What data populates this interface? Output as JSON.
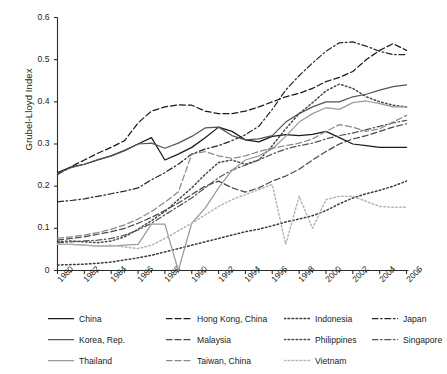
{
  "axes": {
    "ylabel": "Grubel-Lloyd Index",
    "yticks": [
      "0",
      "0.1",
      "0.2",
      "0.3",
      "0.4",
      "0.5",
      "0.6"
    ],
    "xticks": [
      "1980",
      "1982",
      "1984",
      "1986",
      "1988",
      "1990",
      "1992",
      "1994",
      "1996",
      "1998",
      "2000",
      "2002",
      "2004",
      "2006"
    ]
  },
  "legend": {
    "items": [
      {
        "label": "China",
        "style": "solid",
        "color": "#1a1a1a"
      },
      {
        "label": "Hong Kong, China",
        "style": "dashed",
        "color": "#1a1a1a"
      },
      {
        "label": "Indonesia",
        "style": "dotted",
        "color": "#3a3a3a"
      },
      {
        "label": "Japan",
        "style": "dashdot",
        "color": "#2a2a2a"
      },
      {
        "label": "Korea, Rep.",
        "style": "solid",
        "color": "#555555"
      },
      {
        "label": "Malaysia",
        "style": "dashed",
        "color": "#4a4a4a"
      },
      {
        "label": "Philippines",
        "style": "dotted",
        "color": "#4a4a4a"
      },
      {
        "label": "Singapore",
        "style": "dashdot",
        "color": "#555555"
      },
      {
        "label": "Thailand",
        "style": "solid",
        "color": "#9a9a9a"
      },
      {
        "label": "Taiwan, China",
        "style": "dashed",
        "color": "#8a8a8a"
      },
      {
        "label": "Vietnam",
        "style": "dotted",
        "color": "#b5b5b5"
      }
    ]
  },
  "chart_data": {
    "type": "line",
    "title": "",
    "xlabel": "",
    "ylabel": "Grubel-Lloyd Index",
    "xlim": [
      1980,
      2006
    ],
    "ylim": [
      0,
      0.6
    ],
    "grid": false,
    "legend_position": "below",
    "x": [
      1980,
      1981,
      1982,
      1983,
      1984,
      1985,
      1986,
      1987,
      1988,
      1989,
      1990,
      1991,
      1992,
      1993,
      1994,
      1995,
      1996,
      1997,
      1998,
      1999,
      2000,
      2001,
      2002,
      2003,
      2004,
      2005,
      2006
    ],
    "series": [
      {
        "name": "China",
        "style": "solid",
        "color": "#1a1a1a",
        "values": [
          0.232,
          0.245,
          0.252,
          0.262,
          0.272,
          0.285,
          0.3,
          0.315,
          0.262,
          0.276,
          0.292,
          0.315,
          0.34,
          0.33,
          0.31,
          0.305,
          0.318,
          0.322,
          0.32,
          0.323,
          0.33,
          0.315,
          0.3,
          0.296,
          0.292,
          0.292,
          0.292
        ]
      },
      {
        "name": "Hong Kong, China",
        "style": "dashed",
        "color": "#1a1a1a",
        "values": [
          0.228,
          0.246,
          0.262,
          0.278,
          0.292,
          0.308,
          0.35,
          0.378,
          0.388,
          0.393,
          0.392,
          0.378,
          0.372,
          0.372,
          0.378,
          0.388,
          0.4,
          0.412,
          0.42,
          0.432,
          0.448,
          0.458,
          0.472,
          0.5,
          0.522,
          0.538,
          0.522
        ]
      },
      {
        "name": "Indonesia",
        "style": "dotted",
        "color": "#3a3a3a",
        "values": [
          0.013,
          0.014,
          0.015,
          0.017,
          0.02,
          0.025,
          0.03,
          0.036,
          0.044,
          0.052,
          0.06,
          0.068,
          0.076,
          0.084,
          0.092,
          0.098,
          0.106,
          0.115,
          0.122,
          0.13,
          0.142,
          0.158,
          0.172,
          0.182,
          0.19,
          0.2,
          0.212
        ]
      },
      {
        "name": "Japan",
        "style": "dashdot",
        "color": "#2a2a2a",
        "values": [
          0.163,
          0.166,
          0.17,
          0.176,
          0.182,
          0.188,
          0.196,
          0.215,
          0.232,
          0.252,
          0.276,
          0.288,
          0.296,
          0.308,
          0.322,
          0.342,
          0.382,
          0.428,
          0.462,
          0.492,
          0.52,
          0.54,
          0.542,
          0.532,
          0.52,
          0.512,
          0.512
        ]
      },
      {
        "name": "Korea, Rep.",
        "style": "solid",
        "color": "#555555",
        "values": [
          0.23,
          0.244,
          0.252,
          0.263,
          0.272,
          0.284,
          0.3,
          0.302,
          0.29,
          0.302,
          0.318,
          0.338,
          0.34,
          0.32,
          0.31,
          0.312,
          0.32,
          0.352,
          0.372,
          0.388,
          0.4,
          0.4,
          0.412,
          0.418,
          0.428,
          0.436,
          0.44
        ]
      },
      {
        "name": "Malaysia",
        "style": "dashed",
        "color": "#4a4a4a",
        "values": [
          0.072,
          0.076,
          0.08,
          0.086,
          0.092,
          0.1,
          0.112,
          0.126,
          0.142,
          0.16,
          0.18,
          0.2,
          0.212,
          0.196,
          0.186,
          0.196,
          0.212,
          0.224,
          0.24,
          0.262,
          0.282,
          0.3,
          0.312,
          0.32,
          0.33,
          0.34,
          0.348
        ]
      },
      {
        "name": "Philippines",
        "style": "dotted",
        "color": "#4a4a4a",
        "values": [
          0.068,
          0.07,
          0.068,
          0.066,
          0.07,
          0.08,
          0.098,
          0.118,
          0.14,
          0.168,
          0.196,
          0.228,
          0.256,
          0.262,
          0.252,
          0.262,
          0.296,
          0.336,
          0.372,
          0.398,
          0.426,
          0.442,
          0.432,
          0.412,
          0.4,
          0.392,
          0.388
        ]
      },
      {
        "name": "Singapore",
        "style": "dashdot",
        "color": "#555555",
        "values": [
          0.066,
          0.068,
          0.07,
          0.072,
          0.076,
          0.084,
          0.096,
          0.112,
          0.132,
          0.152,
          0.172,
          0.196,
          0.22,
          0.238,
          0.25,
          0.262,
          0.276,
          0.288,
          0.296,
          0.302,
          0.312,
          0.32,
          0.326,
          0.334,
          0.342,
          0.35,
          0.356
        ]
      },
      {
        "name": "Thailand",
        "style": "solid",
        "color": "#9a9a9a",
        "values": [
          0.062,
          0.062,
          0.06,
          0.058,
          0.058,
          0.06,
          0.062,
          0.11,
          0.11,
          0.0,
          0.112,
          0.148,
          0.196,
          0.238,
          0.262,
          0.272,
          0.288,
          0.318,
          0.352,
          0.372,
          0.386,
          0.382,
          0.398,
          0.402,
          0.396,
          0.388,
          0.388
        ]
      },
      {
        "name": "Taiwan, China",
        "style": "dashed",
        "color": "#8a8a8a",
        "values": [
          0.076,
          0.08,
          0.084,
          0.09,
          0.098,
          0.108,
          0.122,
          0.14,
          0.162,
          0.186,
          0.276,
          0.282,
          0.272,
          0.266,
          0.272,
          0.282,
          0.29,
          0.296,
          0.302,
          0.312,
          0.33,
          0.346,
          0.34,
          0.33,
          0.336,
          0.352,
          0.368
        ]
      },
      {
        "name": "Vietnam",
        "style": "dotted",
        "color": "#b5b5b5",
        "values": [
          0.062,
          0.062,
          0.06,
          0.058,
          0.06,
          0.056,
          0.052,
          0.06,
          0.076,
          0.094,
          0.112,
          0.132,
          0.152,
          0.168,
          0.18,
          0.192,
          0.204,
          0.062,
          0.176,
          0.1,
          0.168,
          0.176,
          0.176,
          0.164,
          0.152,
          0.15,
          0.15
        ]
      }
    ]
  }
}
